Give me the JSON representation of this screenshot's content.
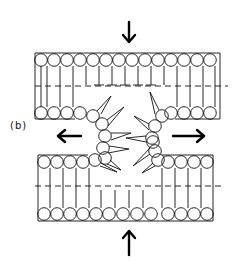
{
  "figure": {
    "panel_label": "(b)",
    "colors": {
      "ink": "#111111",
      "background": "#ffffff"
    },
    "arrows": [
      {
        "direction": "down",
        "position": "top-center"
      },
      {
        "direction": "left",
        "position": "middle-left"
      },
      {
        "direction": "right",
        "position": "middle-right"
      },
      {
        "direction": "up",
        "position": "bottom-center"
      }
    ],
    "upper_bilayer": {
      "top_heads": 14,
      "bottom_heads_left": 4,
      "bottom_heads_right": 4
    },
    "lower_bilayer": {
      "top_heads_left": 4,
      "top_heads_right": 4,
      "bottom_heads": 14
    },
    "splayed_lipids": {
      "left": 6,
      "right": 6
    }
  }
}
